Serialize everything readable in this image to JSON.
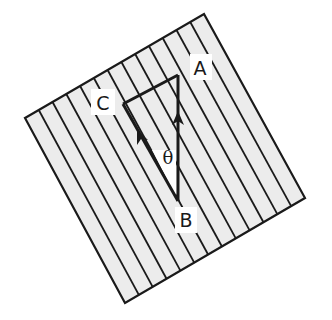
{
  "diagram": {
    "title": "",
    "colors": {
      "background": "#ffffff",
      "square_fill": "#ececec",
      "stroke": "#1a1a1a",
      "label_bg": "#ffffff"
    },
    "square": {
      "corners": {
        "left": [
          25,
          118
        ],
        "top": [
          204,
          14
        ],
        "right": [
          305,
          198
        ],
        "bottom": [
          125,
          303
        ]
      },
      "stripe_count": 12
    },
    "triangle": {
      "vertices": {
        "A": [
          178,
          75
        ],
        "B": [
          178,
          201
        ],
        "C": [
          123,
          104
        ]
      },
      "arrows": [
        {
          "from": "B",
          "to": "A",
          "at": [
            178,
            117
          ]
        },
        {
          "from": "B",
          "to": "C",
          "at": [
            140,
            137
          ]
        }
      ]
    },
    "labels": {
      "A": {
        "text": "A",
        "x": 200,
        "y": 75
      },
      "B": {
        "text": "B",
        "x": 186,
        "y": 227
      },
      "C": {
        "text": "C",
        "x": 103,
        "y": 110
      },
      "theta": {
        "text": "θ",
        "x": 168,
        "y": 164
      }
    }
  }
}
